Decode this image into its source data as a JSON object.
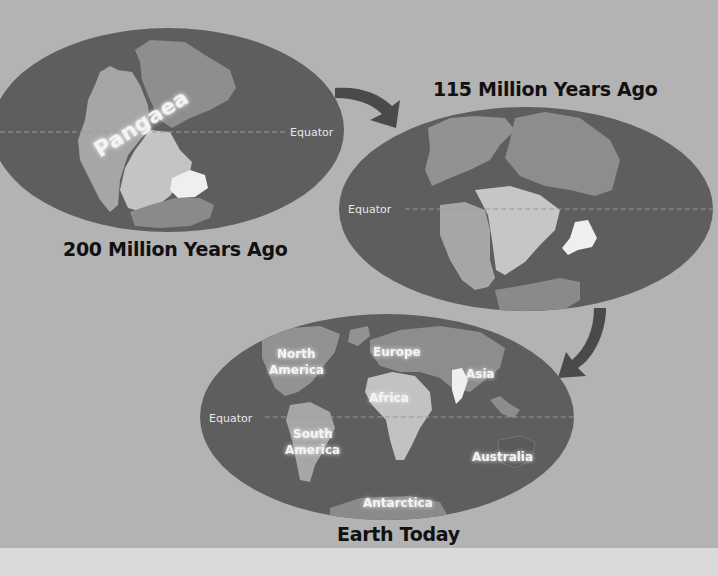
{
  "diagram": {
    "colors": {
      "background": "#b3b3b3",
      "ocean": "#5e5e5e",
      "land_dark": "#8a8a8a",
      "land_mid": "#a9a9a9",
      "land_light": "#c6c6c6",
      "land_highlight": "#f0f0f0",
      "arrow": "#4a4a4a",
      "bottom_strip": "#dadada"
    },
    "panels": [
      {
        "id": "pangaea",
        "title": "200 Million Years Ago",
        "supercontinent_label": "Pangaea",
        "equator_label": "Equator"
      },
      {
        "id": "cretaceous",
        "title": "115 Million Years Ago",
        "equator_label": "Equator"
      },
      {
        "id": "today",
        "title": "Earth Today",
        "equator_label": "Equator",
        "continents": [
          {
            "line1": "North",
            "line2": "America"
          },
          {
            "line1": "Europe"
          },
          {
            "line1": "Asia"
          },
          {
            "line1": "Africa"
          },
          {
            "line1": "South",
            "line2": "America"
          },
          {
            "line1": "Australia"
          },
          {
            "line1": "Antarctica"
          }
        ]
      }
    ],
    "arrows": [
      {
        "from": "200 Million Years Ago",
        "to": "115 Million Years Ago"
      },
      {
        "from": "115 Million Years Ago",
        "to": "Earth Today"
      }
    ]
  }
}
